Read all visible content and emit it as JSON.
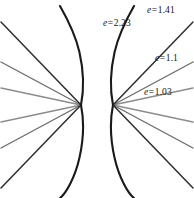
{
  "figure": {
    "background_color": "#ffffff",
    "width": 194,
    "height": 198,
    "symmetry": "mirrored left-right about vertical axis",
    "focus_left": {
      "x": 81,
      "y": 105
    },
    "focus_right": {
      "x": 113,
      "y": 105
    }
  },
  "labels": {
    "e_223": {
      "variable": "e",
      "equals": "=",
      "value": "2.23",
      "text": "e = 2.23"
    },
    "e_141": {
      "variable": "e",
      "equals": "=",
      "value": "1.41",
      "text": "e = 1.41"
    },
    "e_11": {
      "variable": "e",
      "equals": "=",
      "value": "1.1",
      "text": "e = 1.1"
    },
    "e_103": {
      "variable": "e",
      "equals": "=",
      "value": "1.03",
      "text": "e = 1.03"
    }
  },
  "chart_data": {
    "type": "line",
    "xlabel": "",
    "ylabel": "",
    "grid": false,
    "legend_position": "inline-annotations",
    "annotations": [
      "e = 2.23",
      "e = 1.41",
      "e = 1.1",
      "e = 1.03"
    ],
    "series": [
      {
        "name": "e = 2.23",
        "eccentricity": 2.23,
        "color": "#1a1a1a",
        "stroke_width": 2.1,
        "shape": "hyperbola-branch",
        "label_position": {
          "x": 104,
          "y": 24
        }
      },
      {
        "name": "e = 1.41",
        "eccentricity": 1.41,
        "color": "#2e2e2e",
        "stroke_width": 1.5,
        "shape": "near-straight-ray",
        "label_position": {
          "x": 148,
          "y": 10
        }
      },
      {
        "name": "e = 1.1",
        "eccentricity": 1.1,
        "color": "#6d6d6d",
        "stroke_width": 1.4,
        "shape": "near-straight-ray",
        "label_position": {
          "x": 155,
          "y": 58
        }
      },
      {
        "name": "e = 1.03",
        "eccentricity": 1.03,
        "color": "#8c8c8c",
        "stroke_width": 1.4,
        "shape": "near-straight-ray",
        "label_position": {
          "x": 145,
          "y": 91
        }
      }
    ]
  },
  "geometry": {
    "right": {
      "curve_223_upper": "M113,105 C110.4,92 109.6,74 114.6,52 C119.2,32 128,16.5 134,6",
      "curve_223_lower": "M113,105 C110.4,118 109.6,136 114.6,158 C119.2,178 128,193.5 134,198",
      "ray_141_upper": "M113,105 L193,22",
      "ray_141_lower": "M113,105 L193,188",
      "ray_11_upper": "M113,105 L193,62",
      "ray_11_lower": "M113,105 L193,148",
      "ray_103_upper": "M113,105 L193,88",
      "ray_103_lower": "M113,105 L193,122"
    },
    "left": {
      "curve_223_upper": "M81,105 C83.6,92 84.4,74 79.4,52 C74.8,32 66,16.5 60,6",
      "curve_223_lower": "M81,105 C83.6,118 84.4,136 79.4,158 C74.8,178 66,193.5 60,198",
      "ray_141_upper": "M81,105 L1,22",
      "ray_141_lower": "M81,105 L1,188",
      "ray_11_upper": "M81,105 L1,62",
      "ray_11_lower": "M81,105 L1,148",
      "ray_103_upper": "M81,105 L1,88",
      "ray_103_lower": "M81,105 L1,122"
    }
  }
}
